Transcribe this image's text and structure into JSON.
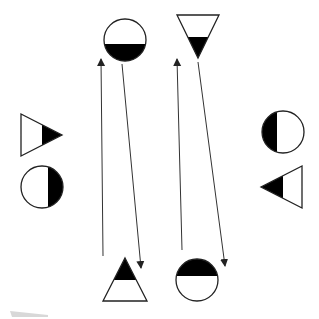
{
  "colors": {
    "background": "#ffffff",
    "stroke": "#222222",
    "fill_dark": "#000000",
    "fill_light": "#ffffff",
    "smudge": "#d8d8d8"
  },
  "diagram": {
    "shapes": [
      {
        "id": "top-circle",
        "type": "circle",
        "cx": 125,
        "cy": 40,
        "r": 21,
        "filled_part": "bottom"
      },
      {
        "id": "top-triangle",
        "type": "triangle-down",
        "points": "177,15 219,15 198,58",
        "filled_part": "bottom"
      },
      {
        "id": "left-triangle",
        "type": "triangle-right",
        "points": "21,114 21,156 62,135",
        "filled_part": "right"
      },
      {
        "id": "left-circle",
        "type": "circle",
        "cx": 42,
        "cy": 187,
        "r": 21,
        "filled_part": "right"
      },
      {
        "id": "right-circle",
        "type": "circle",
        "cx": 283,
        "cy": 132,
        "r": 21,
        "filled_part": "left"
      },
      {
        "id": "right-triangle",
        "type": "triangle-left",
        "points": "302,166 302,208 261,187",
        "filled_part": "left"
      },
      {
        "id": "bottom-triangle",
        "type": "triangle-up",
        "points": "125,258 147,301 103,301",
        "filled_part": "top"
      },
      {
        "id": "bottom-circle",
        "type": "circle",
        "cx": 197,
        "cy": 280,
        "r": 21,
        "filled_part": "top"
      }
    ],
    "arrows": [
      {
        "id": "arrow-bottom-triangle-to-top-circle",
        "x1": 103,
        "y1": 256,
        "x2": 101,
        "y2": 59,
        "direction": "up"
      },
      {
        "id": "arrow-top-circle-to-bottom-triangle",
        "x1": 122,
        "y1": 64,
        "x2": 141,
        "y2": 268,
        "direction": "down"
      },
      {
        "id": "arrow-bottom-circle-to-top-triangle",
        "x1": 182,
        "y1": 250,
        "x2": 177,
        "y2": 59,
        "direction": "up"
      },
      {
        "id": "arrow-top-triangle-to-bottom-circle",
        "x1": 198,
        "y1": 62,
        "x2": 225,
        "y2": 266,
        "direction": "down"
      }
    ]
  }
}
